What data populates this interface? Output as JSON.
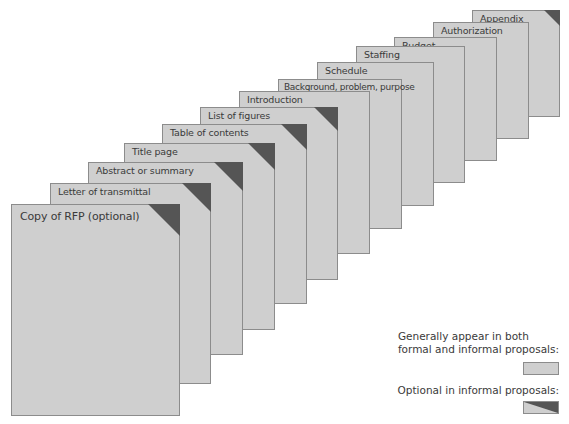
{
  "diagram": {
    "type": "stacked-pages",
    "colors": {
      "page_fill": "#cfcfcf",
      "page_border": "#8c8c8c",
      "optional_corner": "#555555",
      "text": "#3a3a3a"
    },
    "pages": [
      {
        "label": "Appendix",
        "optional_informal": true
      },
      {
        "label": "Authorization",
        "optional_informal": false
      },
      {
        "label": "Budget",
        "optional_informal": false
      },
      {
        "label": "Staffing",
        "optional_informal": false
      },
      {
        "label": "Schedule",
        "optional_informal": false
      },
      {
        "label": "Background, problem, purpose",
        "optional_informal": false
      },
      {
        "label": "Introduction",
        "optional_informal": false
      },
      {
        "label": "List of figures",
        "optional_informal": true
      },
      {
        "label": "Table of contents",
        "optional_informal": true
      },
      {
        "label": "Title page",
        "optional_informal": true
      },
      {
        "label": "Abstract or summary",
        "optional_informal": true
      },
      {
        "label": "Letter of transmittal",
        "optional_informal": true
      },
      {
        "label": "Copy of RFP (optional)",
        "optional_informal": true
      }
    ]
  },
  "legend": {
    "both_line1": "Generally appear in both",
    "both_line2": "formal and informal proposals:",
    "optional": "Optional in informal proposals:"
  }
}
